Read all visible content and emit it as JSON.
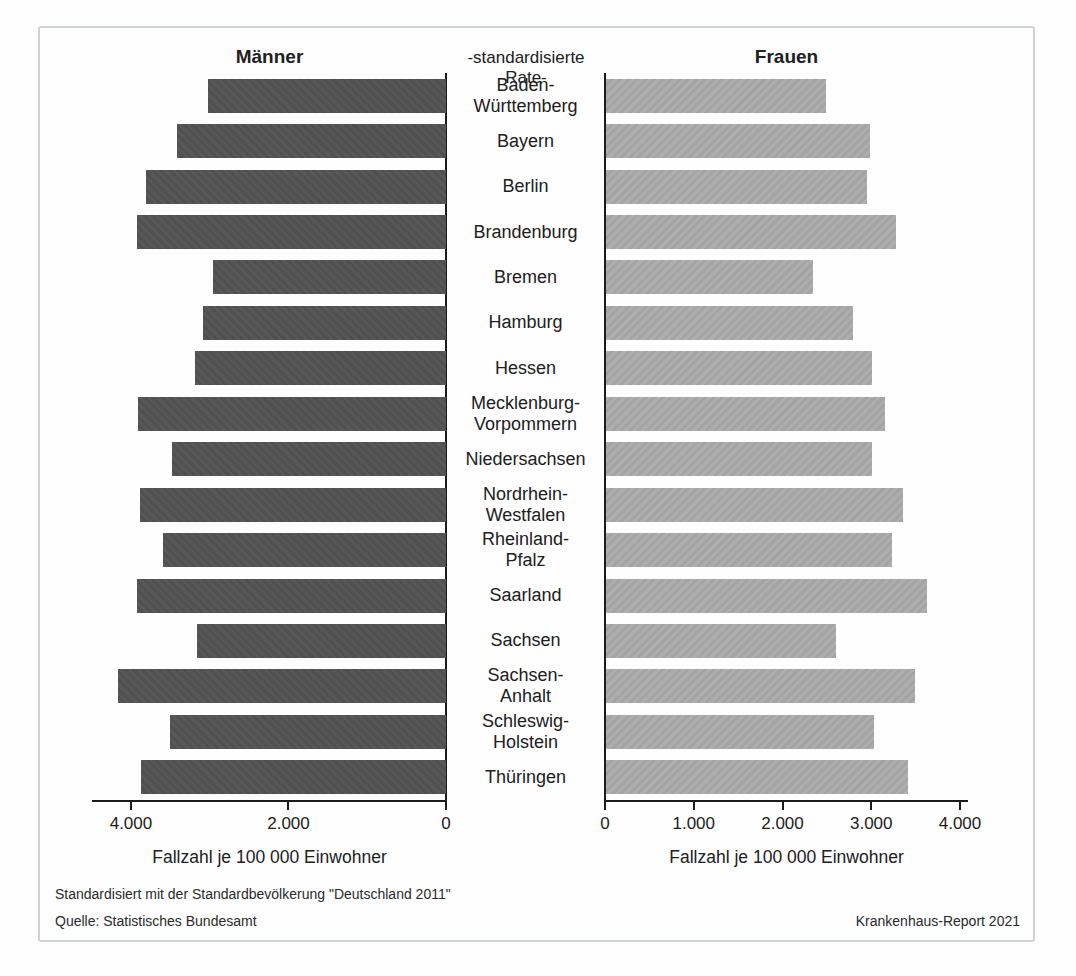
{
  "header": {
    "male": "Männer",
    "center": "-standardisierte Rate-",
    "female": "Frauen"
  },
  "footer": {
    "note": "Standardisiert mit der Standardbevölkerung \"Deutschland 2011\"",
    "source": "Quelle: Statistisches Bundesamt",
    "report": "Krankenhaus-Report 2021"
  },
  "chart_data": {
    "type": "bar",
    "orientation": "horizontal-pyramid",
    "title": "-standardisierte Rate-",
    "xlabel": "Fallzahl je 100 000 Einwohner",
    "grid": false,
    "categories": [
      "Baden-Württemberg",
      "Bayern",
      "Berlin",
      "Brandenburg",
      "Bremen",
      "Hamburg",
      "Hessen",
      "Mecklenburg-Vorpommern",
      "Niedersachsen",
      "Nordrhein-Westfalen",
      "Rheinland-Pfalz",
      "Saarland",
      "Sachsen",
      "Sachsen-Anhalt",
      "Schleswig-Holstein",
      "Thüringen"
    ],
    "category_label_lines": [
      [
        "Baden-",
        "Württemberg"
      ],
      [
        "Bayern"
      ],
      [
        "Berlin"
      ],
      [
        "Brandenburg"
      ],
      [
        "Bremen"
      ],
      [
        "Hamburg"
      ],
      [
        "Hessen"
      ],
      [
        "Mecklenburg-",
        "Vorpommern"
      ],
      [
        "Niedersachsen"
      ],
      [
        "Nordrhein-",
        "Westfalen"
      ],
      [
        "Rheinland-",
        "Pfalz"
      ],
      [
        "Saarland"
      ],
      [
        "Sachsen"
      ],
      [
        "Sachsen-",
        "Anhalt"
      ],
      [
        "Schleswig-",
        "Holstein"
      ],
      [
        "Thüringen"
      ]
    ],
    "series": [
      {
        "name": "Männer",
        "side": "left",
        "color": "#545454",
        "values": [
          3020,
          3420,
          3810,
          3920,
          2960,
          3090,
          3190,
          3910,
          3480,
          3890,
          3590,
          3930,
          3160,
          4170,
          3500,
          3870
        ]
      },
      {
        "name": "Frauen",
        "side": "right",
        "color": "#a9a9a9",
        "values": [
          2480,
          2980,
          2950,
          3280,
          2340,
          2790,
          3010,
          3150,
          3010,
          3350,
          3230,
          3630,
          2600,
          3490,
          3030,
          3410
        ]
      }
    ],
    "axes": {
      "left": {
        "tick_values": [
          4000,
          2000,
          0
        ],
        "tick_labels": [
          "4.000",
          "2.000",
          "0"
        ],
        "domain_max": 4495,
        "anchor": "right"
      },
      "right": {
        "tick_values": [
          0,
          1000,
          2000,
          3000,
          4000
        ],
        "tick_labels": [
          "0",
          "1.000",
          "2.000",
          "3.000",
          "4.000"
        ],
        "domain_max": 4090,
        "anchor": "left"
      }
    }
  }
}
